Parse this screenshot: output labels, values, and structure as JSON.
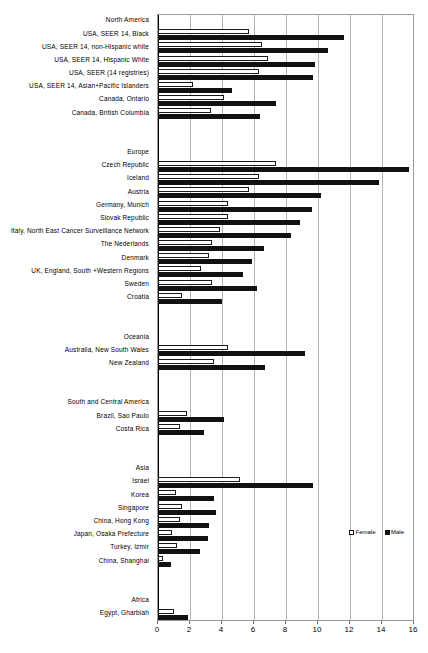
{
  "chart_data": {
    "type": "bar",
    "orientation": "horizontal",
    "title": "",
    "xlabel": "",
    "ylabel": "",
    "xlim": [
      0,
      16
    ],
    "xticks": [
      0,
      2,
      4,
      6,
      8,
      10,
      12,
      14,
      16
    ],
    "xtick_labels": [
      "0",
      "2",
      "4",
      "6",
      "8",
      "10",
      "12",
      "14",
      "16"
    ],
    "grid": true,
    "legend_position": "inside-right",
    "series": [
      {
        "name": "Female",
        "fill": "#ffffff",
        "edge": "#1a1a1a"
      },
      {
        "name": "Male",
        "fill": "#111111",
        "edge": "#111111"
      }
    ],
    "groups": [
      {
        "region": "North America",
        "rows": [
          {
            "label": "USA, SEER 14, Black",
            "female": 5.7,
            "male": 11.6
          },
          {
            "label": "USA, SEER 14, non-Hispanic white",
            "female": 6.5,
            "male": 10.6
          },
          {
            "label": "USA, SEER 14, Hispanic White",
            "female": 6.9,
            "male": 9.8
          },
          {
            "label": "USA, SEER (14 registries)",
            "female": 6.3,
            "male": 9.7
          },
          {
            "label": "USA, SEER 14, Asian+Pacific Islanders",
            "female": 2.2,
            "male": 4.6
          },
          {
            "label": "Canada, Ontario",
            "female": 4.1,
            "male": 7.4
          },
          {
            "label": "Canada, British Columbia",
            "female": 3.3,
            "male": 6.4
          }
        ]
      },
      {
        "region": "Europe",
        "rows": [
          {
            "label": "Czech Republic",
            "female": 7.4,
            "male": 15.7
          },
          {
            "label": "Iceland",
            "female": 6.3,
            "male": 13.8
          },
          {
            "label": "Austria",
            "female": 5.7,
            "male": 10.2
          },
          {
            "label": "Germany, Munich",
            "female": 4.4,
            "male": 9.6
          },
          {
            "label": "Slovak Republic",
            "female": 4.4,
            "male": 8.9
          },
          {
            "label": "Italy, North East Cancer Surveillance Network",
            "female": 3.9,
            "male": 8.3
          },
          {
            "label": "The Nederlands",
            "female": 3.4,
            "male": 6.6
          },
          {
            "label": "Denmark",
            "female": 3.2,
            "male": 5.9
          },
          {
            "label": "UK, England, South +Western Regions",
            "female": 2.7,
            "male": 5.3
          },
          {
            "label": "Sweden",
            "female": 3.4,
            "male": 6.2
          },
          {
            "label": "Croatia",
            "female": 1.5,
            "male": 4.0
          }
        ]
      },
      {
        "region": "Oceania",
        "rows": [
          {
            "label": "Australia, New South Wales",
            "female": 4.4,
            "male": 9.2
          },
          {
            "label": "New Zealand",
            "female": 3.5,
            "male": 6.7
          }
        ]
      },
      {
        "region": "South and Central America",
        "rows": [
          {
            "label": "Brazil, Sao Paulo",
            "female": 1.8,
            "male": 4.1
          },
          {
            "label": "Costa Rica",
            "female": 1.4,
            "male": 2.9
          }
        ]
      },
      {
        "region": "Asia",
        "rows": [
          {
            "label": "Israel",
            "female": 5.1,
            "male": 9.7
          },
          {
            "label": "Korea",
            "female": 1.1,
            "male": 3.5
          },
          {
            "label": "Singapore",
            "female": 1.5,
            "male": 3.6
          },
          {
            "label": "China, Hong Kong",
            "female": 1.4,
            "male": 3.2
          },
          {
            "label": "Japan, Osaka Prefecture",
            "female": 0.9,
            "male": 3.1
          },
          {
            "label": "Turkey, Izmir",
            "female": 1.2,
            "male": 2.6
          },
          {
            "label": "China, Shanghai",
            "female": 0.3,
            "male": 0.8
          }
        ]
      },
      {
        "region": "Africa",
        "rows": [
          {
            "label": "Egypt, Gharbiah",
            "female": 1.0,
            "male": 1.9
          }
        ]
      }
    ]
  },
  "legend": {
    "female_label": "Female",
    "male_label": "Male"
  }
}
